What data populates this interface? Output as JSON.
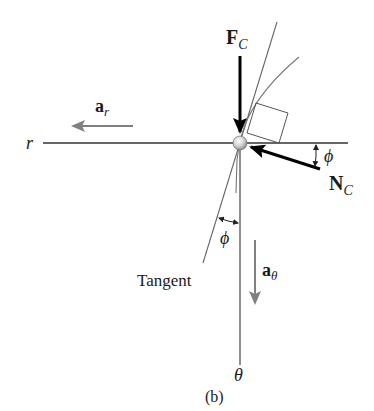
{
  "figure": {
    "caption": "(b)",
    "labels": {
      "force_contact": {
        "main": "F",
        "sub": "C"
      },
      "normal_force": {
        "main": "N",
        "sub": "C"
      },
      "radial_accel": {
        "main": "a",
        "sub": "r"
      },
      "transverse_accel": {
        "main": "a",
        "sub": "θ"
      },
      "r_axis": "r",
      "theta_axis": "θ",
      "phi_upper": "ϕ",
      "phi_lower": "ϕ",
      "tangent": "Tangent"
    },
    "colors": {
      "axis_line": "#333333",
      "force_arrow": "#000000",
      "accel_arrow": "#808080",
      "guide_line": "#666666",
      "ball_fill": "#d8d8d8"
    }
  }
}
